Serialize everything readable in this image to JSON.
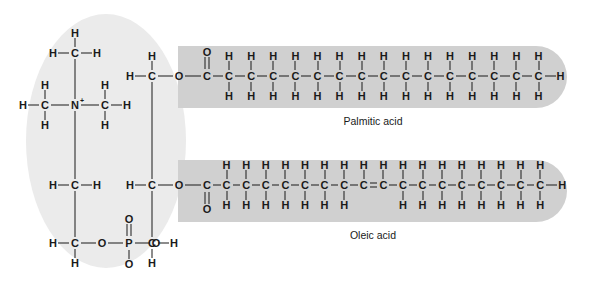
{
  "figure": {
    "type": "chemical-structure",
    "molecule": "phosphatidylcholine",
    "regions": {
      "head_group": "hydrophilic head (choline + phosphate + glycerol)",
      "tail_top": "saturated fatty acid tail",
      "tail_bottom": "unsaturated fatty acid tail"
    },
    "colors": {
      "head_fill": "#ebebeb",
      "tail_fill": "#d0d0d0",
      "ink": "#1a1a1a",
      "background": "#ffffff"
    }
  },
  "labels": {
    "palmitic": "Palmitic acid",
    "oleic": "Oleic acid"
  },
  "atoms": {
    "H": "H",
    "C": "C",
    "N": "N",
    "O": "O",
    "P": "P",
    "plus": "+"
  },
  "choline": {
    "nitrogen": "N",
    "nitrogen_charge": "+",
    "methyl_top": [
      "H",
      "H",
      "C",
      "H"
    ],
    "methyl_left": [
      "H",
      "H",
      "C",
      "H"
    ],
    "methyl_right": [
      "H",
      "H",
      "C",
      "H"
    ],
    "ethyl_upper": [
      "H",
      "C",
      "H"
    ],
    "ethyl_lower": [
      "H",
      "C",
      "H"
    ]
  },
  "phosphate": {
    "center": "P",
    "double_bond_oxygen": "O",
    "lower_oxygen": "O",
    "left_ester_oxygen": "O",
    "right_ester_oxygen": "O"
  },
  "glycerol": {
    "c1": [
      "H",
      "C",
      "H",
      "O"
    ],
    "c2": [
      "H",
      "C",
      "O"
    ],
    "c3": [
      "H",
      "C",
      "H"
    ]
  },
  "chart_data": {
    "type": "table",
    "categories": [
      "Palmitic acid",
      "Oleic acid"
    ],
    "series": [
      {
        "name": "carbon count",
        "values": [
          16,
          18
        ]
      },
      {
        "name": "double bonds",
        "values": [
          0,
          1
        ]
      }
    ],
    "annotations": [
      "Palmitic acid: 16 carbons, fully saturated, straight chain",
      "Oleic acid: 18 carbons, one cis double bond between C9 and C10"
    ],
    "tails": [
      {
        "name": "Palmitic acid",
        "label": "Palmitic acid",
        "carbons": 16,
        "double_bonds": 0,
        "carbonyl_oxygen_position": "above",
        "terminal_hydrogen": "H",
        "backbone": [
          {
            "i": 1,
            "atom": "C",
            "h_above": "O",
            "h_below": null,
            "bond_right": "single",
            "carbonyl": true
          },
          {
            "i": 2,
            "atom": "C",
            "h_above": "H",
            "h_below": "H",
            "bond_right": "single"
          },
          {
            "i": 3,
            "atom": "C",
            "h_above": "H",
            "h_below": "H",
            "bond_right": "single"
          },
          {
            "i": 4,
            "atom": "C",
            "h_above": "H",
            "h_below": "H",
            "bond_right": "single"
          },
          {
            "i": 5,
            "atom": "C",
            "h_above": "H",
            "h_below": "H",
            "bond_right": "single"
          },
          {
            "i": 6,
            "atom": "C",
            "h_above": "H",
            "h_below": "H",
            "bond_right": "single"
          },
          {
            "i": 7,
            "atom": "C",
            "h_above": "H",
            "h_below": "H",
            "bond_right": "single"
          },
          {
            "i": 8,
            "atom": "C",
            "h_above": "H",
            "h_below": "H",
            "bond_right": "single"
          },
          {
            "i": 9,
            "atom": "C",
            "h_above": "H",
            "h_below": "H",
            "bond_right": "single"
          },
          {
            "i": 10,
            "atom": "C",
            "h_above": "H",
            "h_below": "H",
            "bond_right": "single"
          },
          {
            "i": 11,
            "atom": "C",
            "h_above": "H",
            "h_below": "H",
            "bond_right": "single"
          },
          {
            "i": 12,
            "atom": "C",
            "h_above": "H",
            "h_below": "H",
            "bond_right": "single"
          },
          {
            "i": 13,
            "atom": "C",
            "h_above": "H",
            "h_below": "H",
            "bond_right": "single"
          },
          {
            "i": 14,
            "atom": "C",
            "h_above": "H",
            "h_below": "H",
            "bond_right": "single"
          },
          {
            "i": 15,
            "atom": "C",
            "h_above": "H",
            "h_below": "H",
            "bond_right": "single"
          },
          {
            "i": 16,
            "atom": "C",
            "h_above": "H",
            "h_below": "H",
            "bond_right": "terminal-H"
          }
        ]
      },
      {
        "name": "Oleic acid",
        "label": "Oleic acid",
        "carbons": 18,
        "double_bonds": 1,
        "double_bond_between": [
          9,
          10
        ],
        "carbonyl_oxygen_position": "below",
        "terminal_hydrogen": "H",
        "backbone": [
          {
            "i": 1,
            "atom": "C",
            "h_above": null,
            "h_below": "O",
            "bond_right": "single",
            "carbonyl": true
          },
          {
            "i": 2,
            "atom": "C",
            "h_above": "H",
            "h_below": "H",
            "bond_right": "single"
          },
          {
            "i": 3,
            "atom": "C",
            "h_above": "H",
            "h_below": "H",
            "bond_right": "single"
          },
          {
            "i": 4,
            "atom": "C",
            "h_above": "H",
            "h_below": "H",
            "bond_right": "single"
          },
          {
            "i": 5,
            "atom": "C",
            "h_above": "H",
            "h_below": "H",
            "bond_right": "single"
          },
          {
            "i": 6,
            "atom": "C",
            "h_above": "H",
            "h_below": "H",
            "bond_right": "single"
          },
          {
            "i": 7,
            "atom": "C",
            "h_above": "H",
            "h_below": "H",
            "bond_right": "single"
          },
          {
            "i": 8,
            "atom": "C",
            "h_above": "H",
            "h_below": "H",
            "bond_right": "single"
          },
          {
            "i": 9,
            "atom": "C",
            "h_above": "H",
            "h_below": null,
            "bond_right": "double"
          },
          {
            "i": 10,
            "atom": "C",
            "h_above": "H",
            "h_below": null,
            "bond_right": "single"
          },
          {
            "i": 11,
            "atom": "C",
            "h_above": "H",
            "h_below": "H",
            "bond_right": "single"
          },
          {
            "i": 12,
            "atom": "C",
            "h_above": "H",
            "h_below": "H",
            "bond_right": "single"
          },
          {
            "i": 13,
            "atom": "C",
            "h_above": "H",
            "h_below": "H",
            "bond_right": "single"
          },
          {
            "i": 14,
            "atom": "C",
            "h_above": "H",
            "h_below": "H",
            "bond_right": "single"
          },
          {
            "i": 15,
            "atom": "C",
            "h_above": "H",
            "h_below": "H",
            "bond_right": "single"
          },
          {
            "i": 16,
            "atom": "C",
            "h_above": "H",
            "h_below": "H",
            "bond_right": "single"
          },
          {
            "i": 17,
            "atom": "C",
            "h_above": "H",
            "h_below": "H",
            "bond_right": "single"
          },
          {
            "i": 18,
            "atom": "C",
            "h_above": "H",
            "h_below": "H",
            "bond_right": "terminal-H"
          }
        ]
      }
    ]
  }
}
